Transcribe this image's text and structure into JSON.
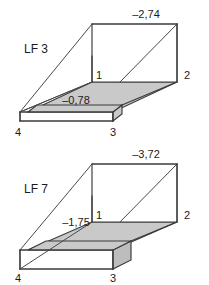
{
  "document": {
    "title": "LF 3 / LF 7 deformation figures",
    "background_color": "#ffffff",
    "line_color": "#3a3a3a",
    "shade_color": "#c9c9c9",
    "text_color": "#1a1a1a"
  },
  "figures": [
    {
      "id": "lf3",
      "case_label": "LF 3",
      "top_value": "–2,74",
      "front_value": "–0,78",
      "corners": {
        "c1": "1",
        "c2": "2",
        "c3": "3",
        "c4": "4"
      }
    },
    {
      "id": "lf7",
      "case_label": "LF 7",
      "top_value": "–3,72",
      "front_value": "–1,75",
      "corners": {
        "c1": "1",
        "c2": "2",
        "c3": "3",
        "c4": "4"
      }
    }
  ]
}
